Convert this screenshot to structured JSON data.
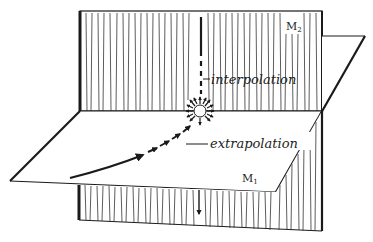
{
  "diagram": {
    "labels": {
      "upper_plane": "M",
      "upper_plane_sub": "2",
      "lower_plane": "M",
      "lower_plane_sub": "1",
      "interpolation": "interpolation",
      "extrapolation": "extrapolation"
    },
    "elements": {
      "vertical_plane": "hatched vertical plane M2",
      "horizontal_plane": "horizontal plane M1",
      "focus_point": "radiating point at intersection",
      "trajectory_arrow": "curved arrow approaching point",
      "down_arrow": "downward arrow below horizontal plane",
      "dashed_vertical": "dashed vertical line above point"
    },
    "colors": {
      "ink": "#1a1a1a",
      "background": "#ffffff"
    }
  }
}
